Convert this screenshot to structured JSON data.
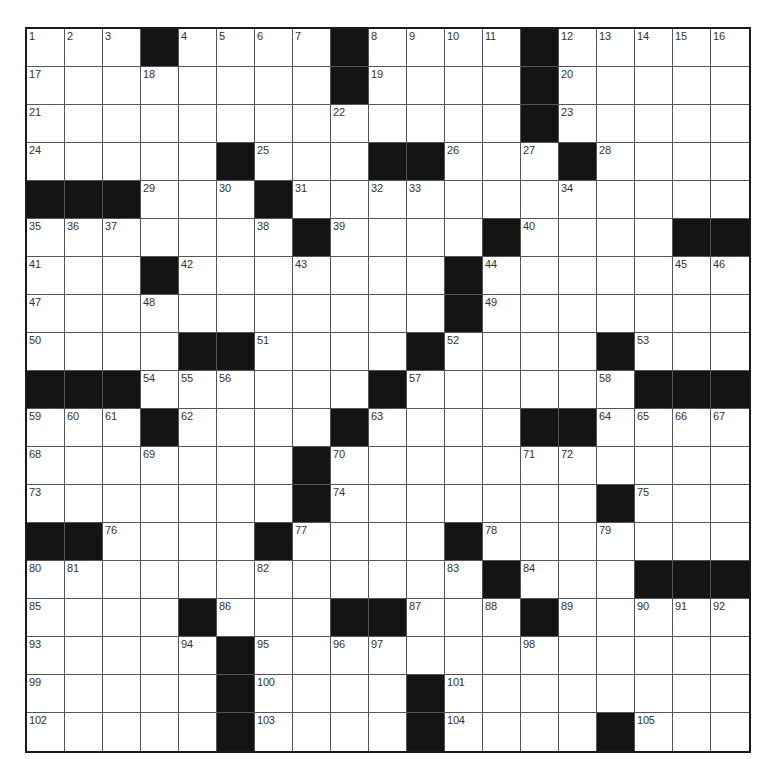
{
  "puzzle": {
    "rows": 19,
    "cols": 19,
    "colors": {
      "black_square": "#141414",
      "white_square": "#ffffff",
      "grid_line": "#555555",
      "border": "#1a1a1a",
      "number_text": "#333333"
    },
    "grid": [
      [
        "1",
        "2",
        "3",
        "#",
        "4",
        "5",
        "6",
        "7",
        "#",
        "8",
        "9",
        "10",
        "11",
        "#",
        "12",
        "13",
        "14",
        "15",
        "16"
      ],
      [
        "17",
        "",
        "",
        "18",
        "",
        "",
        "",
        "",
        "#",
        "19",
        "",
        "",
        "",
        "#",
        "20",
        "",
        "",
        "",
        ""
      ],
      [
        "21",
        "",
        "",
        "",
        "",
        "",
        "",
        "",
        "22",
        "",
        "",
        "",
        "",
        "#",
        "23",
        "",
        "",
        "",
        ""
      ],
      [
        "24",
        "",
        "",
        "",
        "",
        "#",
        "25",
        "",
        "",
        "#",
        "#",
        "26",
        "",
        "27",
        "#",
        "28",
        "",
        "",
        ""
      ],
      [
        "#",
        "#",
        "#",
        "29",
        "",
        "30",
        "#",
        "31",
        "",
        "32",
        "33",
        "",
        "",
        "",
        "34",
        "",
        "",
        "",
        ""
      ],
      [
        "35",
        "36",
        "37",
        "",
        "",
        "",
        "38",
        "#",
        "39",
        "",
        "",
        "",
        "#",
        "40",
        "",
        "",
        "",
        "#",
        "#"
      ],
      [
        "41",
        "",
        "",
        "#",
        "42",
        "",
        "",
        "43",
        "",
        "",
        "",
        "#",
        "44",
        "",
        "",
        "",
        "",
        "45",
        "46"
      ],
      [
        "47",
        "",
        "",
        "48",
        "",
        "",
        "",
        "",
        "",
        "",
        "",
        "#",
        "49",
        "",
        "",
        "",
        "",
        "",
        ""
      ],
      [
        "50",
        "",
        "",
        "",
        "#",
        "#",
        "51",
        "",
        "",
        "",
        "#",
        "52",
        "",
        "",
        "",
        "#",
        "53",
        "",
        ""
      ],
      [
        "#",
        "#",
        "#",
        "54",
        "55",
        "56",
        "",
        "",
        "",
        "#",
        "57",
        "",
        "",
        "",
        "",
        "58",
        "#",
        "#",
        "#"
      ],
      [
        "59",
        "60",
        "61",
        "#",
        "62",
        "",
        "",
        "",
        "#",
        "63",
        "",
        "",
        "",
        "#",
        "#",
        "64",
        "65",
        "66",
        "67"
      ],
      [
        "68",
        "",
        "",
        "69",
        "",
        "",
        "",
        "#",
        "70",
        "",
        "",
        "",
        "",
        "71",
        "72",
        "",
        "",
        "",
        ""
      ],
      [
        "73",
        "",
        "",
        "",
        "",
        "",
        "",
        "#",
        "74",
        "",
        "",
        "",
        "",
        "",
        "",
        "#",
        "75",
        "",
        ""
      ],
      [
        "#",
        "#",
        "76",
        "",
        "",
        "",
        "#",
        "77",
        "",
        "",
        "",
        "#",
        "78",
        "",
        "",
        "79",
        "",
        "",
        ""
      ],
      [
        "80",
        "81",
        "",
        "",
        "",
        "",
        "82",
        "",
        "",
        "",
        "",
        "83",
        "#",
        "84",
        "",
        "",
        "#",
        "#",
        "#"
      ],
      [
        "85",
        "",
        "",
        "",
        "#",
        "86",
        "",
        "",
        "#",
        "#",
        "87",
        "",
        "88",
        "#",
        "89",
        "",
        "90",
        "91",
        "92"
      ],
      [
        "93",
        "",
        "",
        "",
        "94",
        "#",
        "95",
        "",
        "96",
        "97",
        "",
        "",
        "",
        "98",
        "",
        "",
        "",
        "",
        ""
      ],
      [
        "99",
        "",
        "",
        "",
        "",
        "#",
        "100",
        "",
        "",
        "",
        "#",
        "101",
        "",
        "",
        "",
        "",
        "",
        "",
        ""
      ],
      [
        "102",
        "",
        "",
        "",
        "",
        "#",
        "103",
        "",
        "",
        "",
        "#",
        "104",
        "",
        "",
        "",
        "#",
        "105",
        "",
        ""
      ]
    ],
    "entries": []
  }
}
